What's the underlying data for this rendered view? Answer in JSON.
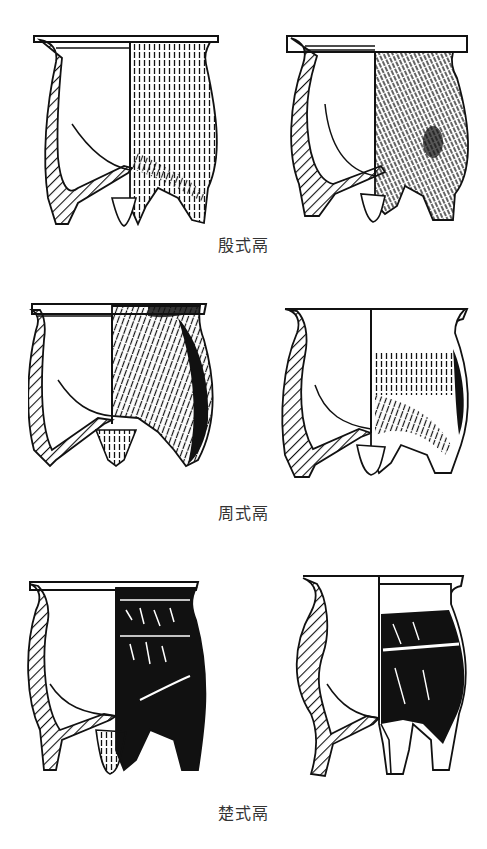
{
  "figure": {
    "groups": [
      {
        "label": "殷式鬲",
        "vessels": [
          "yin-li-left",
          "yin-li-right"
        ]
      },
      {
        "label": "周式鬲",
        "vessels": [
          "zhou-li-left",
          "zhou-li-right"
        ]
      },
      {
        "label": "楚式鬲",
        "vessels": [
          "chu-li-left",
          "chu-li-right"
        ]
      }
    ]
  },
  "colors": {
    "ink": "#111111",
    "paper": "#ffffff",
    "caption": "#333333"
  }
}
